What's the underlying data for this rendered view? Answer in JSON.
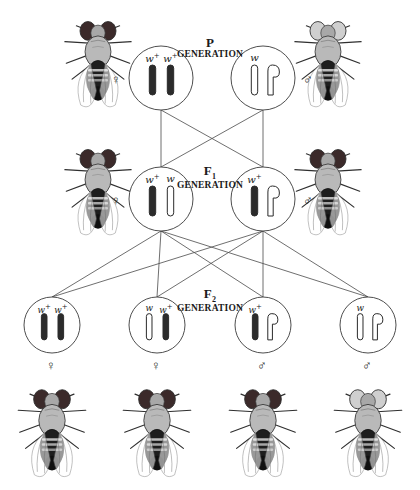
{
  "diagram": {
    "background": "#ffffff",
    "line_color": "#4a4a4a",
    "circle_stroke": "#3a3a3a",
    "allele_dark_color": "#2b2b2b",
    "allele_light_color": "#ffffff",
    "eye_red_color": "#3b2a2a",
    "eye_white_color": "#cfcfcf"
  },
  "generations": [
    {
      "id": "P",
      "label_main": "P",
      "label_sub": "GENERATION",
      "subscript": "",
      "x": 210,
      "y": 46
    },
    {
      "id": "F1",
      "label_main": "F",
      "label_sub": "GENERATION",
      "subscript": "1",
      "x": 210,
      "y": 174
    },
    {
      "id": "F2",
      "label_main": "F",
      "label_sub": "GENERATION",
      "subscript": "2",
      "x": 210,
      "y": 297
    }
  ],
  "cells": [
    {
      "name": "p-female-cell",
      "generation": "P",
      "sex": "female",
      "sex_symbol": "♀",
      "sex_symbol_pos": "left",
      "cx": 161,
      "cy": 78,
      "r": 32,
      "chromosomes": [
        {
          "type": "x",
          "fill": "dark",
          "allele": "w",
          "superscript": "+"
        },
        {
          "type": "x",
          "fill": "dark",
          "allele": "w",
          "superscript": "+"
        }
      ]
    },
    {
      "name": "p-male-cell",
      "generation": "P",
      "sex": "male",
      "sex_symbol": "♂",
      "sex_symbol_pos": "right",
      "cx": 263,
      "cy": 78,
      "r": 32,
      "chromosomes": [
        {
          "type": "x",
          "fill": "light",
          "allele": "w",
          "superscript": ""
        },
        {
          "type": "y",
          "fill": "light",
          "allele": "",
          "superscript": ""
        }
      ]
    },
    {
      "name": "f1-female-cell",
      "generation": "F1",
      "sex": "female",
      "sex_symbol": "♀",
      "sex_symbol_pos": "left",
      "cx": 161,
      "cy": 199,
      "r": 32,
      "chromosomes": [
        {
          "type": "x",
          "fill": "dark",
          "allele": "w",
          "superscript": "+"
        },
        {
          "type": "x",
          "fill": "light",
          "allele": "w",
          "superscript": ""
        }
      ]
    },
    {
      "name": "f1-male-cell",
      "generation": "F1",
      "sex": "male",
      "sex_symbol": "♂",
      "sex_symbol_pos": "right",
      "cx": 263,
      "cy": 199,
      "r": 32,
      "chromosomes": [
        {
          "type": "x",
          "fill": "dark",
          "allele": "w",
          "superscript": "+"
        },
        {
          "type": "y",
          "fill": "light",
          "allele": "",
          "superscript": ""
        }
      ]
    },
    {
      "name": "f2-female-cell-1",
      "generation": "F2",
      "sex": "female",
      "sex_symbol": "♀",
      "sex_symbol_pos": "below",
      "cx": 52,
      "cy": 325,
      "r": 28,
      "chromosomes": [
        {
          "type": "x",
          "fill": "dark",
          "allele": "w",
          "superscript": "+"
        },
        {
          "type": "x",
          "fill": "dark",
          "allele": "w",
          "superscript": "+"
        }
      ]
    },
    {
      "name": "f2-female-cell-2",
      "generation": "F2",
      "sex": "female",
      "sex_symbol": "♀",
      "sex_symbol_pos": "below",
      "cx": 157,
      "cy": 325,
      "r": 28,
      "chromosomes": [
        {
          "type": "x",
          "fill": "light",
          "allele": "w",
          "superscript": ""
        },
        {
          "type": "x",
          "fill": "dark",
          "allele": "w",
          "superscript": "+"
        }
      ]
    },
    {
      "name": "f2-male-cell-1",
      "generation": "F2",
      "sex": "male",
      "sex_symbol": "♂",
      "sex_symbol_pos": "below",
      "cx": 263,
      "cy": 325,
      "r": 28,
      "chromosomes": [
        {
          "type": "x",
          "fill": "dark",
          "allele": "w",
          "superscript": "+"
        },
        {
          "type": "y",
          "fill": "light",
          "allele": "",
          "superscript": ""
        }
      ]
    },
    {
      "name": "f2-male-cell-2",
      "generation": "F2",
      "sex": "male",
      "sex_symbol": "♂",
      "sex_symbol_pos": "below",
      "cx": 368,
      "cy": 325,
      "r": 28,
      "chromosomes": [
        {
          "type": "x",
          "fill": "light",
          "allele": "w",
          "superscript": ""
        },
        {
          "type": "y",
          "fill": "light",
          "allele": "",
          "superscript": ""
        }
      ]
    }
  ],
  "flies": [
    {
      "name": "p-female-fly",
      "generation": "P",
      "sex": "female",
      "eye": "red",
      "x": 62,
      "y": 8,
      "w": 72,
      "h": 112
    },
    {
      "name": "p-male-fly",
      "generation": "P",
      "sex": "male",
      "eye": "white",
      "x": 292,
      "y": 8,
      "w": 72,
      "h": 112
    },
    {
      "name": "f1-female-fly",
      "generation": "F1",
      "sex": "female",
      "eye": "red",
      "x": 62,
      "y": 136,
      "w": 72,
      "h": 112
    },
    {
      "name": "f1-male-fly",
      "generation": "F1",
      "sex": "male",
      "eye": "red",
      "x": 292,
      "y": 136,
      "w": 72,
      "h": 112
    },
    {
      "name": "f2-fly-1",
      "generation": "F2",
      "sex": "female",
      "eye": "red",
      "x": 14,
      "y": 378,
      "w": 76,
      "h": 110
    },
    {
      "name": "f2-fly-2",
      "generation": "F2",
      "sex": "female",
      "eye": "red",
      "x": 119,
      "y": 378,
      "w": 76,
      "h": 110
    },
    {
      "name": "f2-fly-3",
      "generation": "F2",
      "sex": "male",
      "eye": "red",
      "x": 225,
      "y": 378,
      "w": 76,
      "h": 110
    },
    {
      "name": "f2-fly-4",
      "generation": "F2",
      "sex": "male",
      "eye": "white",
      "x": 330,
      "y": 378,
      "w": 76,
      "h": 110
    }
  ],
  "connections": [
    {
      "name": "p-female-to-f1-female",
      "from": "p-female-cell",
      "to": "f1-female-cell"
    },
    {
      "name": "p-female-to-f1-male",
      "from": "p-female-cell",
      "to": "f1-male-cell"
    },
    {
      "name": "p-male-to-f1-female",
      "from": "p-male-cell",
      "to": "f1-female-cell"
    },
    {
      "name": "p-male-to-f1-male",
      "from": "p-male-cell",
      "to": "f1-male-cell"
    },
    {
      "name": "f1-female-to-f2-1",
      "from": "f1-female-cell",
      "to": "f2-female-cell-1"
    },
    {
      "name": "f1-female-to-f2-2",
      "from": "f1-female-cell",
      "to": "f2-female-cell-2"
    },
    {
      "name": "f1-female-to-f2-3",
      "from": "f1-female-cell",
      "to": "f2-male-cell-1"
    },
    {
      "name": "f1-female-to-f2-4",
      "from": "f1-female-cell",
      "to": "f2-male-cell-2"
    },
    {
      "name": "f1-male-to-f2-1",
      "from": "f1-male-cell",
      "to": "f2-female-cell-1"
    },
    {
      "name": "f1-male-to-f2-2",
      "from": "f1-male-cell",
      "to": "f2-female-cell-2"
    },
    {
      "name": "f1-male-to-f2-3",
      "from": "f1-male-cell",
      "to": "f2-male-cell-1"
    },
    {
      "name": "f1-male-to-f2-4",
      "from": "f1-male-cell",
      "to": "f2-male-cell-2"
    }
  ]
}
